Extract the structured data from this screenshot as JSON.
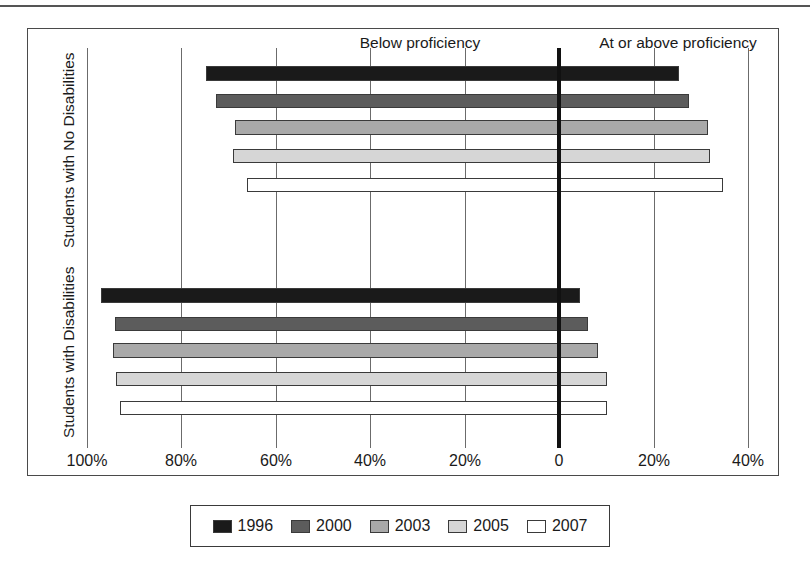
{
  "figure": {
    "top_rule": true,
    "axis_headers": {
      "left": "Below proficiency",
      "right": "At or above proficiency"
    },
    "group_labels": {
      "top": "Students with No Disabilities",
      "bottom": "Students with Disabilities"
    }
  },
  "legend": {
    "items": [
      {
        "label": "1996",
        "color": "#1a1a1a"
      },
      {
        "label": "2000",
        "color": "#5c5c5c"
      },
      {
        "label": "2003",
        "color": "#a9a9a9"
      },
      {
        "label": "2005",
        "color": "#d6d6d6"
      },
      {
        "label": "2007",
        "color": "#ffffff"
      }
    ]
  },
  "chart_data": {
    "type": "bar",
    "orientation": "horizontal",
    "layout": "diverging-stacked",
    "title": "",
    "subtitle": "",
    "xlabel": "",
    "ylabel": "",
    "grid": true,
    "legend_position": "bottom",
    "xlim": [
      -100,
      40
    ],
    "x_ticks": [
      -100,
      -80,
      -60,
      -40,
      -20,
      0,
      20,
      40
    ],
    "x_tick_labels": [
      "100%",
      "80%",
      "60%",
      "40%",
      "20%",
      "0",
      "20%",
      "40%"
    ],
    "zero_reference": 0,
    "left_header": "Below proficiency",
    "right_header": "At or above proficiency",
    "categories": [
      "Students with No Disabilities",
      "Students with Disabilities"
    ],
    "series": [
      {
        "name": "1996",
        "color": "#1a1a1a",
        "groups": [
          {
            "category": "Students with No Disabilities",
            "below_proficiency": 74.7,
            "at_or_above_proficiency": 25.4
          },
          {
            "category": "Students with Disabilities",
            "below_proficiency": 96.9,
            "at_or_above_proficiency": 4.4
          }
        ]
      },
      {
        "name": "2000",
        "color": "#5c5c5c",
        "groups": [
          {
            "category": "Students with No Disabilities",
            "below_proficiency": 72.6,
            "at_or_above_proficiency": 27.5
          },
          {
            "category": "Students with Disabilities",
            "below_proficiency": 94.0,
            "at_or_above_proficiency": 6.1
          }
        ]
      },
      {
        "name": "2003",
        "color": "#a9a9a9",
        "groups": [
          {
            "category": "Students with No Disabilities",
            "below_proficiency": 68.6,
            "at_or_above_proficiency": 31.5
          },
          {
            "category": "Students with Disabilities",
            "below_proficiency": 94.4,
            "at_or_above_proficiency": 8.3
          }
        ]
      },
      {
        "name": "2005",
        "color": "#d6d6d6",
        "groups": [
          {
            "category": "Students with No Disabilities",
            "below_proficiency": 69.0,
            "at_or_above_proficiency": 32.0
          },
          {
            "category": "Students with Disabilities",
            "below_proficiency": 93.8,
            "at_or_above_proficiency": 10.2
          }
        ]
      },
      {
        "name": "2007",
        "color": "#ffffff",
        "groups": [
          {
            "category": "Students with No Disabilities",
            "below_proficiency": 66.0,
            "at_or_above_proficiency": 34.7
          },
          {
            "category": "Students with Disabilities",
            "below_proficiency": 92.9,
            "at_or_above_proficiency": 10.2
          }
        ]
      }
    ]
  },
  "geometry": {
    "x_zero_px": 559,
    "px_per_percent": 4.725,
    "bar_rows": {
      "Students with No Disabilities": [
        {
          "series": "1996",
          "top": 66,
          "height": 15
        },
        {
          "series": "2000",
          "top": 94,
          "height": 14
        },
        {
          "series": "2003",
          "top": 120,
          "height": 15
        },
        {
          "series": "2005",
          "top": 149,
          "height": 14
        },
        {
          "series": "2007",
          "top": 178,
          "height": 14
        }
      ],
      "Students with Disabilities": [
        {
          "series": "1996",
          "top": 288,
          "height": 15
        },
        {
          "series": "2000",
          "top": 317,
          "height": 14
        },
        {
          "series": "2003",
          "top": 343,
          "height": 15
        },
        {
          "series": "2005",
          "top": 372,
          "height": 14
        },
        {
          "series": "2007",
          "top": 401,
          "height": 14
        }
      ]
    },
    "grid_top": 48,
    "grid_bottom": 448,
    "tick_label_y": 452
  }
}
